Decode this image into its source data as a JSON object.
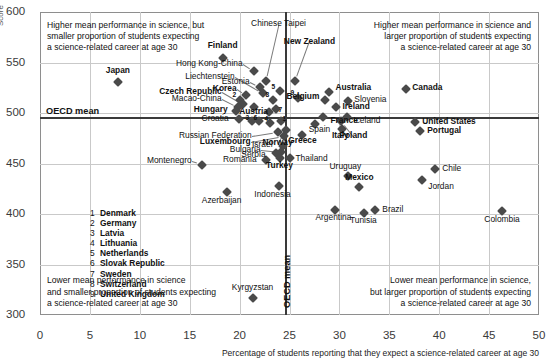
{
  "chart_data": {
    "type": "scatter",
    "title": "",
    "xlabel": "Percentage of students reporting that they expect a science-related career at age 30",
    "ylabel": "Score",
    "xlim": [
      0,
      50
    ],
    "ylim": [
      300,
      600
    ],
    "xticks": [
      0,
      5,
      10,
      15,
      20,
      25,
      30,
      35,
      40,
      45,
      50
    ],
    "yticks": [
      300,
      350,
      400,
      450,
      500,
      550,
      600
    ],
    "grid": true,
    "legend_position": "inside-lower-left",
    "reference_lines": {
      "horizontal": {
        "label": "OECD mean",
        "value": 496
      },
      "vertical": {
        "label": "OECD mean",
        "value": 24.5
      }
    },
    "annotations": [
      {
        "id": "q-top-left",
        "text": "Higher mean performance in science, but\nsmaller proportion of students expecting\na science-related career at age 30"
      },
      {
        "id": "q-top-right",
        "text": "Higher mean performance in science and\nlarger proportion of students expecting\na science-related career at age 30"
      },
      {
        "id": "q-bottom-left",
        "text": "Lower mean performance in science\nand smaller proportion of students expecting\na science-related career at age 30"
      },
      {
        "id": "q-bottom-right",
        "text": "Lower mean performance in science,\nbut larger proportion of students expecting\na science-related career at age 30"
      }
    ],
    "legend_items": [
      {
        "n": "1",
        "name": "Denmark"
      },
      {
        "n": "2",
        "name": "Germany"
      },
      {
        "n": "3",
        "name": "Latvia"
      },
      {
        "n": "4",
        "name": "Lithuania"
      },
      {
        "n": "5",
        "name": "Netherlands"
      },
      {
        "n": "6",
        "name": "Slovak Republic"
      },
      {
        "n": "7",
        "name": "Sweden"
      },
      {
        "n": "8",
        "name": "Switzerland"
      },
      {
        "n": "9",
        "name": "United Kingdom"
      }
    ],
    "points": [
      {
        "name": "Finland",
        "x": 18.3,
        "y": 554,
        "label": "Finland",
        "lx": 18.3,
        "ly": 566,
        "anchor": "center",
        "bold": true
      },
      {
        "name": "Chinese Taipei",
        "x": 22.6,
        "y": 532,
        "label": "Chinese Taipei",
        "lx": 23.9,
        "ly": 588,
        "anchor": "center",
        "bold": false,
        "leader": true
      },
      {
        "name": "New Zealand",
        "x": 25.6,
        "y": 532,
        "label": "New Zealand",
        "lx": 27.0,
        "ly": 570,
        "anchor": "center",
        "bold": true,
        "leader": true
      },
      {
        "name": "Hong Kong-China",
        "x": 21.4,
        "y": 542,
        "label": "Hong Kong-China",
        "lx": 20.3,
        "ly": 549,
        "anchor": "right",
        "bold": false,
        "leader": true
      },
      {
        "name": "Japan",
        "x": 7.8,
        "y": 531,
        "label": "Japan",
        "lx": 7.8,
        "ly": 542,
        "anchor": "center",
        "bold": true
      },
      {
        "name": "Estonia",
        "x": 22.0,
        "y": 526,
        "label": "Estonia",
        "lx": 21.0,
        "ly": 531,
        "anchor": "right",
        "bold": false,
        "leader": true
      },
      {
        "name": "Liechtenstein",
        "x": 22.3,
        "y": 520,
        "label": "Liechtenstein",
        "lx": 19.5,
        "ly": 536,
        "anchor": "right",
        "bold": false,
        "leader": true
      },
      {
        "name": "Korea",
        "x": 20.6,
        "y": 518,
        "label": "Korea",
        "lx": 19.7,
        "ly": 524,
        "anchor": "right",
        "bold": true,
        "leader": true
      },
      {
        "name": "Netherlands-5a",
        "x": 24.0,
        "y": 522,
        "label": "5",
        "num": true,
        "lx": 23.2,
        "ly": 526,
        "anchor": "center",
        "bold": false
      },
      {
        "name": "UnitedKingdom-9",
        "x": 25.9,
        "y": 515,
        "label": "9",
        "num": true,
        "lx": 25.1,
        "ly": 520,
        "anchor": "center",
        "bold": false
      },
      {
        "name": "Germany-2",
        "x": 20.0,
        "y": 513,
        "label": "2",
        "num": true,
        "lx": 19.3,
        "ly": 518,
        "anchor": "center",
        "bold": false
      },
      {
        "name": "Switzerland-8",
        "x": 23.3,
        "y": 513,
        "label": "8",
        "num": true,
        "lx": 22.6,
        "ly": 518,
        "anchor": "center",
        "bold": false
      },
      {
        "name": "Czech Republic",
        "x": 20.3,
        "y": 509,
        "label": "Czech Republic",
        "lx": 18.2,
        "ly": 521,
        "anchor": "right",
        "bold": true,
        "leader": true
      },
      {
        "name": "Macao-China",
        "x": 19.8,
        "y": 506,
        "label": "Macao-China",
        "lx": 18.2,
        "ly": 514,
        "anchor": "right",
        "bold": false,
        "leader": true
      },
      {
        "name": "Austria",
        "x": 21.4,
        "y": 506,
        "label": "Austria",
        "lx": 21.4,
        "ly": 501,
        "anchor": "center",
        "bold": true
      },
      {
        "name": "Hungary",
        "x": 19.6,
        "y": 502,
        "label": "Hungary",
        "lx": 18.8,
        "ly": 503,
        "anchor": "right",
        "bold": true
      },
      {
        "name": "Sweden-7",
        "x": 23.6,
        "y": 504,
        "label": "7",
        "num": true,
        "lx": 23.9,
        "ly": 503,
        "anchor": "center",
        "bold": false
      },
      {
        "name": "Slovenia-x",
        "x": 22.9,
        "y": 501,
        "label": "",
        "lx": 0,
        "ly": 0,
        "anchor": "center",
        "bold": false
      },
      {
        "name": "Croatia",
        "x": 19.9,
        "y": 494,
        "label": "Croatia",
        "lx": 18.9,
        "ly": 494,
        "anchor": "right",
        "bold": false
      },
      {
        "name": "Latvia-3",
        "x": 21.2,
        "y": 492,
        "label": "3",
        "num": true,
        "lx": 20.6,
        "ly": 495,
        "anchor": "center",
        "bold": false
      },
      {
        "name": "SlovakRep-6",
        "x": 21.9,
        "y": 492,
        "label": "6",
        "num": true,
        "lx": 21.4,
        "ly": 495,
        "anchor": "center",
        "bold": false
      },
      {
        "name": "Lithuania-4",
        "x": 23.0,
        "y": 490,
        "label": "4",
        "num": true,
        "lx": 22.5,
        "ly": 494,
        "anchor": "center",
        "bold": false
      },
      {
        "name": "Denmark-1",
        "x": 24.1,
        "y": 492,
        "label": "1",
        "num": true,
        "lx": 24.3,
        "ly": 494,
        "anchor": "center",
        "bold": false
      },
      {
        "name": "Russian Federation",
        "x": 23.8,
        "y": 481,
        "label": "Russian Federation",
        "lx": 21.2,
        "ly": 477,
        "anchor": "right",
        "bold": false,
        "leader": true
      },
      {
        "name": "Luxembourg",
        "x": 24.4,
        "y": 477,
        "label": "Luxembourg",
        "lx": 21.1,
        "ly": 471,
        "anchor": "right",
        "bold": true,
        "leader": true
      },
      {
        "name": "Norway",
        "x": 24.6,
        "y": 483,
        "label": "Norway",
        "lx": 23.8,
        "ly": 470,
        "anchor": "center",
        "bold": true,
        "leader": true
      },
      {
        "name": "Israel",
        "x": 24.3,
        "y": 467,
        "label": "Israel",
        "lx": 23.3,
        "ly": 468,
        "anchor": "right",
        "bold": false
      },
      {
        "name": "Bulgaria",
        "x": 24.1,
        "y": 461,
        "label": "Bulgaria",
        "lx": 22.1,
        "ly": 463,
        "anchor": "right",
        "bold": false,
        "leader": true
      },
      {
        "name": "Serbia",
        "x": 23.6,
        "y": 460,
        "label": "Serbia",
        "lx": 22.6,
        "ly": 458,
        "anchor": "right",
        "bold": false
      },
      {
        "name": "Romania",
        "x": 22.6,
        "y": 453,
        "label": "Romania",
        "lx": 21.7,
        "ly": 453,
        "anchor": "right",
        "bold": false
      },
      {
        "name": "Turkey",
        "x": 24.0,
        "y": 455,
        "label": "Turkey",
        "lx": 24.0,
        "ly": 448,
        "anchor": "center",
        "bold": true
      },
      {
        "name": "Montenegro",
        "x": 16.2,
        "y": 449,
        "label": "Montenegro",
        "lx": 15.2,
        "ly": 452,
        "anchor": "right",
        "bold": false,
        "leader": true
      },
      {
        "name": "Thailand",
        "x": 25.0,
        "y": 455,
        "label": "Thailand",
        "lx": 25.6,
        "ly": 454,
        "anchor": "left",
        "bold": false
      },
      {
        "name": "Indonesia",
        "x": 23.9,
        "y": 428,
        "label": "Indonesia",
        "lx": 23.3,
        "ly": 419,
        "anchor": "center",
        "bold": false
      },
      {
        "name": "Azerbaijan",
        "x": 18.7,
        "y": 422,
        "label": "Azerbaijan",
        "lx": 18.2,
        "ly": 413,
        "anchor": "center",
        "bold": false
      },
      {
        "name": "Kyrgyzstan",
        "x": 21.3,
        "y": 317,
        "label": "Kyrgyzstan",
        "lx": 21.3,
        "ly": 327,
        "anchor": "center",
        "bold": false
      },
      {
        "name": "Australia",
        "x": 29.0,
        "y": 521,
        "label": "Australia",
        "lx": 29.6,
        "ly": 525,
        "anchor": "left",
        "bold": true
      },
      {
        "name": "Belgium",
        "x": 28.6,
        "y": 513,
        "label": "Belgium",
        "lx": 28.0,
        "ly": 516,
        "anchor": "right",
        "bold": true
      },
      {
        "name": "Slovenia",
        "x": 30.9,
        "y": 512,
        "label": "Slovenia",
        "lx": 31.5,
        "ly": 513,
        "anchor": "left",
        "bold": false
      },
      {
        "name": "Ireland",
        "x": 29.7,
        "y": 506,
        "label": "Ireland",
        "lx": 30.3,
        "ly": 506,
        "anchor": "left",
        "bold": true
      },
      {
        "name": "Canada",
        "x": 36.7,
        "y": 524,
        "label": "Canada",
        "lx": 37.3,
        "ly": 525,
        "anchor": "left",
        "bold": true
      },
      {
        "name": "France",
        "x": 28.4,
        "y": 496,
        "label": "France",
        "lx": 29.1,
        "ly": 492,
        "anchor": "left",
        "bold": true
      },
      {
        "name": "Iceland",
        "x": 30.8,
        "y": 496,
        "label": "Iceland",
        "lx": 31.4,
        "ly": 492,
        "anchor": "left",
        "bold": false
      },
      {
        "name": "Spain",
        "x": 27.6,
        "y": 489,
        "label": "Spain",
        "lx": 28.0,
        "ly": 483,
        "anchor": "center",
        "bold": false
      },
      {
        "name": "Greece",
        "x": 26.3,
        "y": 478,
        "label": "Greece",
        "lx": 26.3,
        "ly": 472,
        "anchor": "center",
        "bold": true
      },
      {
        "name": "Italy",
        "x": 30.3,
        "y": 484,
        "label": "Italy",
        "lx": 30.1,
        "ly": 477,
        "anchor": "center",
        "bold": true
      },
      {
        "name": "Poland",
        "x": 30.2,
        "y": 492,
        "label": "Poland",
        "lx": 31.4,
        "ly": 477,
        "anchor": "center",
        "bold": true,
        "leader": true
      },
      {
        "name": "United States",
        "x": 37.6,
        "y": 491,
        "label": "United States",
        "lx": 38.3,
        "ly": 491,
        "anchor": "left",
        "bold": true
      },
      {
        "name": "Portugal",
        "x": 38.1,
        "y": 482,
        "label": "Portugal",
        "lx": 38.8,
        "ly": 482,
        "anchor": "left",
        "bold": true
      },
      {
        "name": "Uruguay",
        "x": 30.9,
        "y": 438,
        "label": "Uruguay",
        "lx": 30.6,
        "ly": 447,
        "anchor": "center",
        "bold": false
      },
      {
        "name": "Chile",
        "x": 39.6,
        "y": 445,
        "label": "Chile",
        "lx": 40.3,
        "ly": 445,
        "anchor": "left",
        "bold": false
      },
      {
        "name": "Mexico",
        "x": 32.0,
        "y": 427,
        "label": "Mexico",
        "lx": 32.0,
        "ly": 436,
        "anchor": "center",
        "bold": true
      },
      {
        "name": "Jordan",
        "x": 38.3,
        "y": 434,
        "label": "Jordan",
        "lx": 38.9,
        "ly": 427,
        "anchor": "left",
        "bold": false
      },
      {
        "name": "Argentina",
        "x": 29.6,
        "y": 404,
        "label": "Argentina",
        "lx": 29.4,
        "ly": 396,
        "anchor": "center",
        "bold": false
      },
      {
        "name": "Tunisia",
        "x": 32.5,
        "y": 401,
        "label": "Tunisia",
        "lx": 32.4,
        "ly": 393,
        "anchor": "center",
        "bold": false
      },
      {
        "name": "Brazil",
        "x": 33.6,
        "y": 404,
        "label": "Brazil",
        "lx": 34.3,
        "ly": 404,
        "anchor": "left",
        "bold": false
      },
      {
        "name": "Colombia",
        "x": 46.3,
        "y": 403,
        "label": "Colombia",
        "lx": 46.3,
        "ly": 394,
        "anchor": "center",
        "bold": false
      }
    ]
  }
}
